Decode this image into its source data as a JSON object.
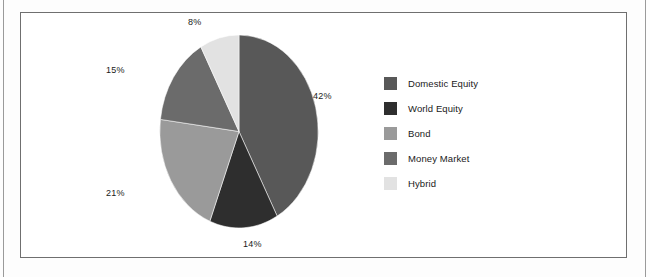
{
  "chart_data": {
    "type": "pie",
    "title": "",
    "categories": [
      "Domestic Equity",
      "World Equity",
      "Bond",
      "Money Market",
      "Hybrid"
    ],
    "values": [
      42,
      14,
      21,
      15,
      8
    ],
    "value_labels": [
      "42%",
      "14%",
      "21%",
      "15%",
      "8%"
    ],
    "unit": "%",
    "colors": [
      "#585858",
      "#2e2e2e",
      "#9a9a9a",
      "#6b6b6b",
      "#e2e2e2"
    ],
    "legend_position": "right",
    "grid": false,
    "start_angle_deg": 0,
    "direction": "clockwise"
  },
  "slices": [
    {
      "label": "Domestic Equity",
      "value": 42,
      "value_label": "42%",
      "color": "#585858"
    },
    {
      "label": "World Equity",
      "value": 14,
      "value_label": "14%",
      "color": "#2e2e2e"
    },
    {
      "label": "Bond",
      "value": 21,
      "value_label": "21%",
      "color": "#9a9a9a"
    },
    {
      "label": "Money Market",
      "value": 15,
      "value_label": "15%",
      "color": "#6b6b6b"
    },
    {
      "label": "Hybrid",
      "value": 8,
      "value_label": "8%",
      "color": "#e2e2e2"
    }
  ],
  "legend": {
    "items": [
      {
        "label": "Domestic Equity",
        "color": "#585858"
      },
      {
        "label": "World Equity",
        "color": "#2e2e2e"
      },
      {
        "label": "Bond",
        "color": "#9a9a9a"
      },
      {
        "label": "Money Market",
        "color": "#6b6b6b"
      },
      {
        "label": "Hybrid",
        "color": "#e2e2e2"
      }
    ]
  },
  "frame": {
    "border_color": "#6f6f6f",
    "background": "#ffffff"
  }
}
